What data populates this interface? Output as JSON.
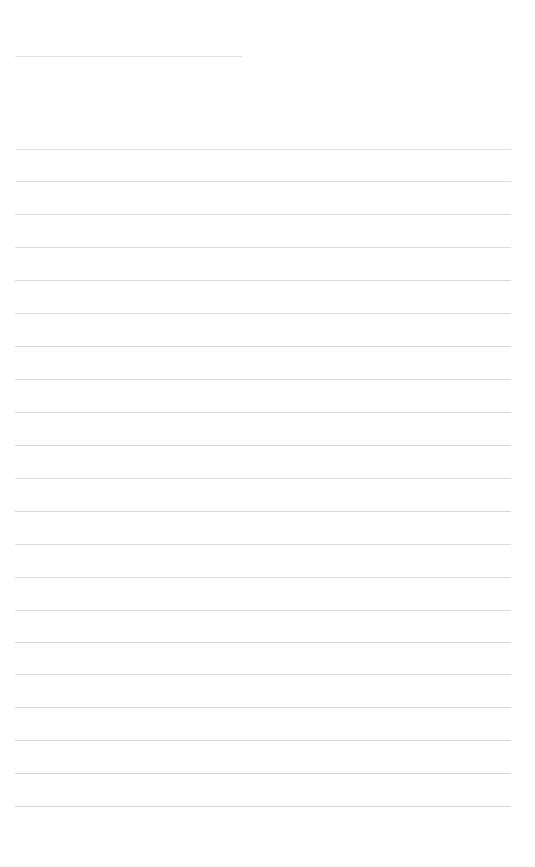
{
  "document": {
    "kind": "lined-paper",
    "title_text": "",
    "background_color": "#ffffff",
    "page_width": 535,
    "page_height": 867,
    "body_text": "",
    "notes_text": ""
  },
  "ruling": {
    "line_color": "#c9c9ce",
    "line_thickness_px": 1,
    "line_spacing_px": 33,
    "margin_left_px": 15,
    "margin_right_px": 511,
    "full_line_count": 21,
    "short_line_count": 1,
    "bottom_blank_px": 61
  },
  "header_rule": {
    "label": "header-rule",
    "y": 56,
    "x_start": 15,
    "x_end": 242,
    "opacity": 0.55
  },
  "lines": [
    {
      "index": 1,
      "y": 149,
      "x_start": 15,
      "x_end": 511,
      "opacity": 0.6
    },
    {
      "index": 2,
      "y": 181,
      "x_start": 15,
      "x_end": 511,
      "opacity": 0.62
    },
    {
      "index": 3,
      "y": 214,
      "x_start": 15,
      "x_end": 511,
      "opacity": 0.66
    },
    {
      "index": 4,
      "y": 247,
      "x_start": 15,
      "x_end": 511,
      "opacity": 0.62
    },
    {
      "index": 5,
      "y": 280,
      "x_start": 15,
      "x_end": 511,
      "opacity": 0.7
    },
    {
      "index": 6,
      "y": 313,
      "x_start": 15,
      "x_end": 511,
      "opacity": 0.64
    },
    {
      "index": 7,
      "y": 346,
      "x_start": 15,
      "x_end": 511,
      "opacity": 0.72
    },
    {
      "index": 8,
      "y": 379,
      "x_start": 15,
      "x_end": 511,
      "opacity": 0.66
    },
    {
      "index": 9,
      "y": 412,
      "x_start": 15,
      "x_end": 511,
      "opacity": 0.7
    },
    {
      "index": 10,
      "y": 445,
      "x_start": 15,
      "x_end": 511,
      "opacity": 0.72
    },
    {
      "index": 11,
      "y": 478,
      "x_start": 15,
      "x_end": 511,
      "opacity": 0.62
    },
    {
      "index": 12,
      "y": 511,
      "x_start": 15,
      "x_end": 511,
      "opacity": 0.74
    },
    {
      "index": 13,
      "y": 544,
      "x_start": 15,
      "x_end": 511,
      "opacity": 0.62
    },
    {
      "index": 14,
      "y": 577,
      "x_start": 15,
      "x_end": 511,
      "opacity": 0.7
    },
    {
      "index": 15,
      "y": 610,
      "x_start": 15,
      "x_end": 511,
      "opacity": 0.66
    },
    {
      "index": 16,
      "y": 642,
      "x_start": 15,
      "x_end": 511,
      "opacity": 0.72
    },
    {
      "index": 17,
      "y": 674,
      "x_start": 15,
      "x_end": 511,
      "opacity": 0.68
    },
    {
      "index": 18,
      "y": 707,
      "x_start": 15,
      "x_end": 511,
      "opacity": 0.72
    },
    {
      "index": 19,
      "y": 740,
      "x_start": 15,
      "x_end": 511,
      "opacity": 0.74
    },
    {
      "index": 20,
      "y": 773,
      "x_start": 15,
      "x_end": 511,
      "opacity": 0.78
    },
    {
      "index": 21,
      "y": 806,
      "x_start": 15,
      "x_end": 511,
      "opacity": 0.74
    }
  ]
}
